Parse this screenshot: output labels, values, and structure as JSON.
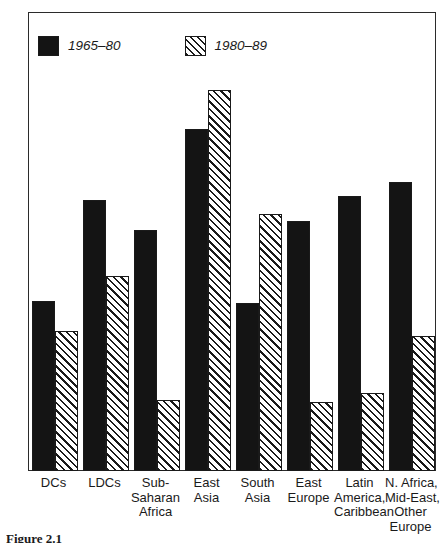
{
  "chart_data": {
    "type": "bar",
    "title": "",
    "xlabel": "",
    "ylabel": "",
    "ylim": [
      0,
      10
    ],
    "yticks": [
      0,
      2,
      4,
      6,
      8,
      10
    ],
    "ytick_labels": [
      "0",
      "2",
      "4",
      "6",
      "8",
      "10"
    ],
    "grid": false,
    "legend_position": "upper-left-inside",
    "categories": [
      "DCs",
      "LDCs",
      "Sub-Saharan Africa",
      "East Asia",
      "South Asia",
      "East Europe",
      "Latin America, Caribbean",
      "N. Africa, Mid-East, Other Europe"
    ],
    "category_label_lines": [
      [
        "DCs"
      ],
      [
        "LDCs"
      ],
      [
        "Sub-",
        "Saharan",
        "Africa"
      ],
      [
        "East",
        "Asia"
      ],
      [
        "South",
        "Asia"
      ],
      [
        "East",
        "Europe"
      ],
      [
        "Latin",
        "America,",
        "Caribbean"
      ],
      [
        "N. Africa,",
        "Mid-East,",
        "Other",
        "Europe"
      ]
    ],
    "series": [
      {
        "name": "1965–80",
        "pattern": "solid-black",
        "values": [
          3.7,
          5.9,
          5.25,
          7.45,
          3.65,
          5.45,
          6.0,
          6.3
        ]
      },
      {
        "name": "1980–89",
        "pattern": "diagonal-hatch",
        "values": [
          3.05,
          4.25,
          1.55,
          8.3,
          5.6,
          1.5,
          1.7,
          2.95
        ]
      }
    ]
  },
  "legend": {
    "entries": [
      {
        "label": "1965–80",
        "swatch": "solid-black-swatch"
      },
      {
        "label": "1980–89",
        "swatch": "diagonal-hatch-swatch"
      }
    ]
  },
  "caption": {
    "text": "Figure 2.1"
  },
  "colors": {
    "series1": "#141414",
    "series2_lines": "#1a1a1a",
    "axis": "#2b2b2b",
    "background": "#ffffff",
    "text": "#1a1a1a"
  }
}
